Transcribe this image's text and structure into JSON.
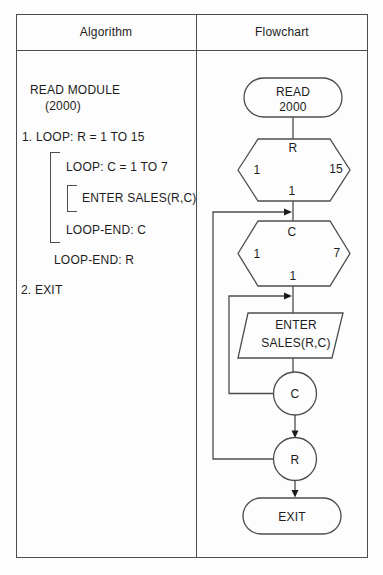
{
  "header": {
    "algorithm_label": "Algorithm",
    "flowchart_label": "Flowchart"
  },
  "algorithm": {
    "read_module": "READ MODULE",
    "module_number": "(2000)",
    "step_1": "1. LOOP: R = 1 TO 15",
    "loop_c": "LOOP: C = 1 TO 7",
    "enter_sales": "ENTER SALES(R,C)",
    "loop_end_c": "LOOP-END: C",
    "loop_end_r": "LOOP-END: R",
    "step_2": "2. EXIT"
  },
  "flowchart": {
    "read_terminator": {
      "line1": "READ",
      "line2": "2000"
    },
    "hexagon_r": {
      "variable": "R",
      "from": "1",
      "to": "15",
      "step": "1"
    },
    "hexagon_c": {
      "variable": "C",
      "from": "1",
      "to": "7",
      "step": "1"
    },
    "enter_parallelogram": {
      "line1": "ENTER",
      "line2": "SALES(R,C)"
    },
    "connector_c": "C",
    "connector_r": "R",
    "exit_terminator": "EXIT"
  },
  "colors": {
    "ink": "#1c1c1c",
    "line": "#4d4d4d",
    "background": "#fdfdfd"
  }
}
